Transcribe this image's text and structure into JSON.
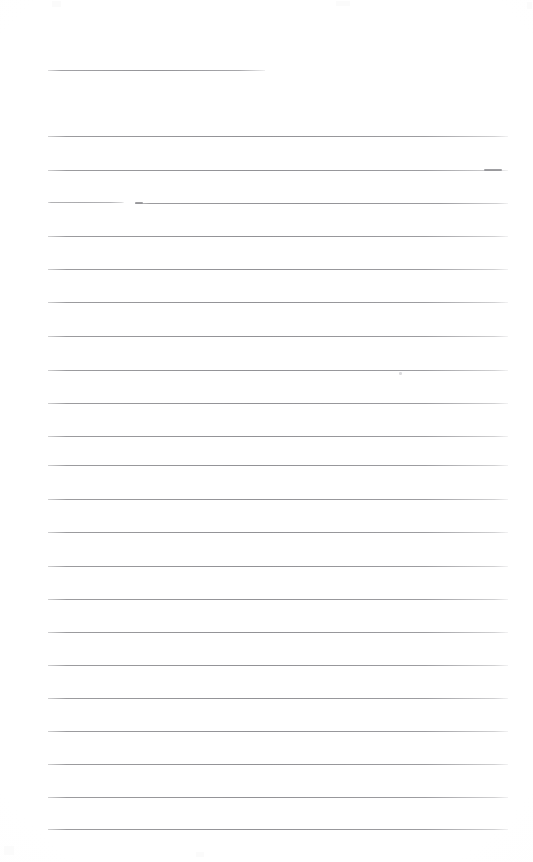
{
  "page": {
    "kind": "scanned-lined-paper",
    "width": 533,
    "height": 862,
    "background_color": "#ffffff",
    "rule_color": "#94949a",
    "content_text": "",
    "header_text": "",
    "footer_text": "",
    "page_number": ""
  },
  "ruling": {
    "line_count": 23,
    "left_margin_x": 48,
    "right_margin_x": 508,
    "line_spacing_px": 33.5,
    "first_line_y": 70,
    "last_line_y": 829,
    "short_first_line": true,
    "short_first_line_end_x": 265
  },
  "lines": [
    {
      "id": 1,
      "y": 70,
      "x1": 48,
      "x2": 265,
      "variant": "short"
    },
    {
      "id": 2,
      "y": 136,
      "x1": 48,
      "x2": 508,
      "variant": "full"
    },
    {
      "id": 3,
      "y": 170,
      "x1": 48,
      "x2": 508,
      "variant": "full-tip"
    },
    {
      "id": 4,
      "y": 203,
      "x1": 48,
      "x2": 508,
      "variant": "broken"
    },
    {
      "id": 5,
      "y": 236,
      "x1": 48,
      "x2": 508,
      "variant": "full"
    },
    {
      "id": 6,
      "y": 269,
      "x1": 48,
      "x2": 508,
      "variant": "full"
    },
    {
      "id": 7,
      "y": 302,
      "x1": 48,
      "x2": 508,
      "variant": "full"
    },
    {
      "id": 8,
      "y": 336,
      "x1": 48,
      "x2": 508,
      "variant": "full"
    },
    {
      "id": 9,
      "y": 370,
      "x1": 48,
      "x2": 508,
      "variant": "full"
    },
    {
      "id": 10,
      "y": 403,
      "x1": 48,
      "x2": 508,
      "variant": "full"
    },
    {
      "id": 11,
      "y": 436,
      "x1": 48,
      "x2": 508,
      "variant": "full"
    },
    {
      "id": 12,
      "y": 465,
      "x1": 48,
      "x2": 508,
      "variant": "full"
    },
    {
      "id": 13,
      "y": 499,
      "x1": 48,
      "x2": 508,
      "variant": "full"
    },
    {
      "id": 14,
      "y": 532,
      "x1": 48,
      "x2": 508,
      "variant": "full"
    },
    {
      "id": 15,
      "y": 566,
      "x1": 48,
      "x2": 508,
      "variant": "full"
    },
    {
      "id": 16,
      "y": 599,
      "x1": 48,
      "x2": 508,
      "variant": "full"
    },
    {
      "id": 17,
      "y": 632,
      "x1": 48,
      "x2": 508,
      "variant": "full"
    },
    {
      "id": 18,
      "y": 665,
      "x1": 48,
      "x2": 508,
      "variant": "full"
    },
    {
      "id": 19,
      "y": 698,
      "x1": 48,
      "x2": 508,
      "variant": "full"
    },
    {
      "id": 20,
      "y": 731,
      "x1": 48,
      "x2": 508,
      "variant": "full"
    },
    {
      "id": 21,
      "y": 764,
      "x1": 48,
      "x2": 508,
      "variant": "full"
    },
    {
      "id": 22,
      "y": 797,
      "x1": 48,
      "x2": 508,
      "variant": "full"
    },
    {
      "id": 23,
      "y": 829,
      "x1": 48,
      "x2": 508,
      "variant": "full"
    }
  ],
  "broken_line": {
    "line_id": 4,
    "gap_start_x": 124,
    "gap_end_x": 135
  },
  "marks": [
    {
      "name": "smudge-upper-right",
      "x": 399,
      "y": 372,
      "w": 3,
      "h": 3
    },
    {
      "name": "scan-speck-top-left",
      "x": 52,
      "y": 1,
      "w": 9,
      "h": 6
    },
    {
      "name": "scan-speck-top-center",
      "x": 336,
      "y": 1,
      "w": 14,
      "h": 5
    },
    {
      "name": "scan-speck-top-right",
      "x": 527,
      "y": 2,
      "w": 5,
      "h": 7
    },
    {
      "name": "scan-speck-bottom-left",
      "x": 4,
      "y": 846,
      "w": 10,
      "h": 9
    },
    {
      "name": "scan-speck-bottom-center",
      "x": 196,
      "y": 852,
      "w": 8,
      "h": 5
    }
  ]
}
